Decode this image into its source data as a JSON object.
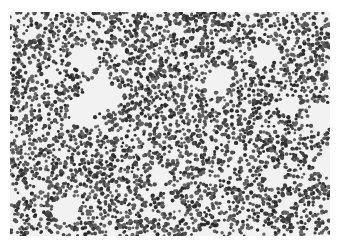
{
  "image": {
    "subject": "cell-micrograph",
    "description": "Grayscale micrograph of densely packed small round dark cells on a light background",
    "colors": {
      "background": "#f2f2f2",
      "cell_dark": "#3a3a3a",
      "cell_mid": "#6e6e6e",
      "page": "#ffffff"
    }
  }
}
